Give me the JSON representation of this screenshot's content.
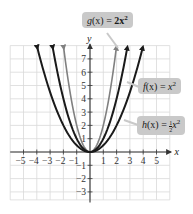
{
  "chart_data": {
    "type": "line",
    "title": "",
    "xlabel": "x",
    "ylabel": "y",
    "xlim": [
      -5.8,
      6
    ],
    "ylim": [
      -3.8,
      8
    ],
    "x_ticks": [
      -5,
      -4,
      -3,
      -2,
      -1,
      1,
      2,
      3,
      4,
      5
    ],
    "x_tick_labels": [
      "−5",
      "−4",
      "−3",
      "−2",
      "−1",
      "1",
      "2",
      "3",
      "4",
      "5"
    ],
    "y_ticks": [
      -3,
      -2,
      -1,
      1,
      2,
      3,
      4,
      5,
      6,
      7
    ],
    "y_tick_labels": [
      "−3",
      "−2",
      "−1",
      "1",
      "2",
      "3",
      "4",
      "5",
      "6",
      "7"
    ],
    "grid": true,
    "series": [
      {
        "name": "g(x) = 2x²",
        "formula": "2x^2",
        "coef": 2,
        "color": "#808080",
        "style": "gray",
        "x": [
          -2,
          -1,
          0,
          1,
          2
        ],
        "y": [
          8,
          2,
          0,
          2,
          8
        ]
      },
      {
        "name": "f(x) = x²",
        "formula": "x^2",
        "coef": 1,
        "color": "#1a1a1a",
        "style": "black",
        "x": [
          -2.8,
          -2,
          -1,
          0,
          1,
          2,
          2.8
        ],
        "y": [
          7.84,
          4,
          1,
          0,
          1,
          4,
          7.84
        ]
      },
      {
        "name": "h(x) = ½x²",
        "formula": "(1/2)x^2",
        "coef": 0.5,
        "color": "#1a1a1a",
        "style": "black",
        "x": [
          -4,
          -3,
          -2,
          -1,
          0,
          1,
          2,
          3,
          4
        ],
        "y": [
          8,
          4.5,
          2,
          0.5,
          0,
          0.5,
          2,
          4.5,
          8
        ]
      }
    ],
    "annotations": [
      {
        "text": "g(x) = 2x²",
        "points_to": "g"
      },
      {
        "text": "f(x) = x²",
        "points_to": "f"
      },
      {
        "text": "h(x) = ½x²",
        "points_to": "h"
      }
    ]
  },
  "labels": {
    "g": {
      "name": "g",
      "arg": "(x)",
      "eq": " = ",
      "rhs": "2x",
      "exp": "2"
    },
    "f": {
      "name": "f",
      "arg": "(x)",
      "eq": " = ",
      "rhs": "x",
      "exp": "2"
    },
    "h": {
      "name": "h",
      "arg": "(x)",
      "eq": " = ",
      "frac_num": "1",
      "frac_den": "2",
      "rhs": "x",
      "exp": "2"
    }
  },
  "axes": {
    "x_label": "x",
    "y_label": "y"
  },
  "colors": {
    "grid": "#d9d9d9",
    "axis": "#333333",
    "label_bg": "#c9c9c9",
    "curve_dark": "#1a1a1a",
    "curve_gray": "#808080"
  }
}
